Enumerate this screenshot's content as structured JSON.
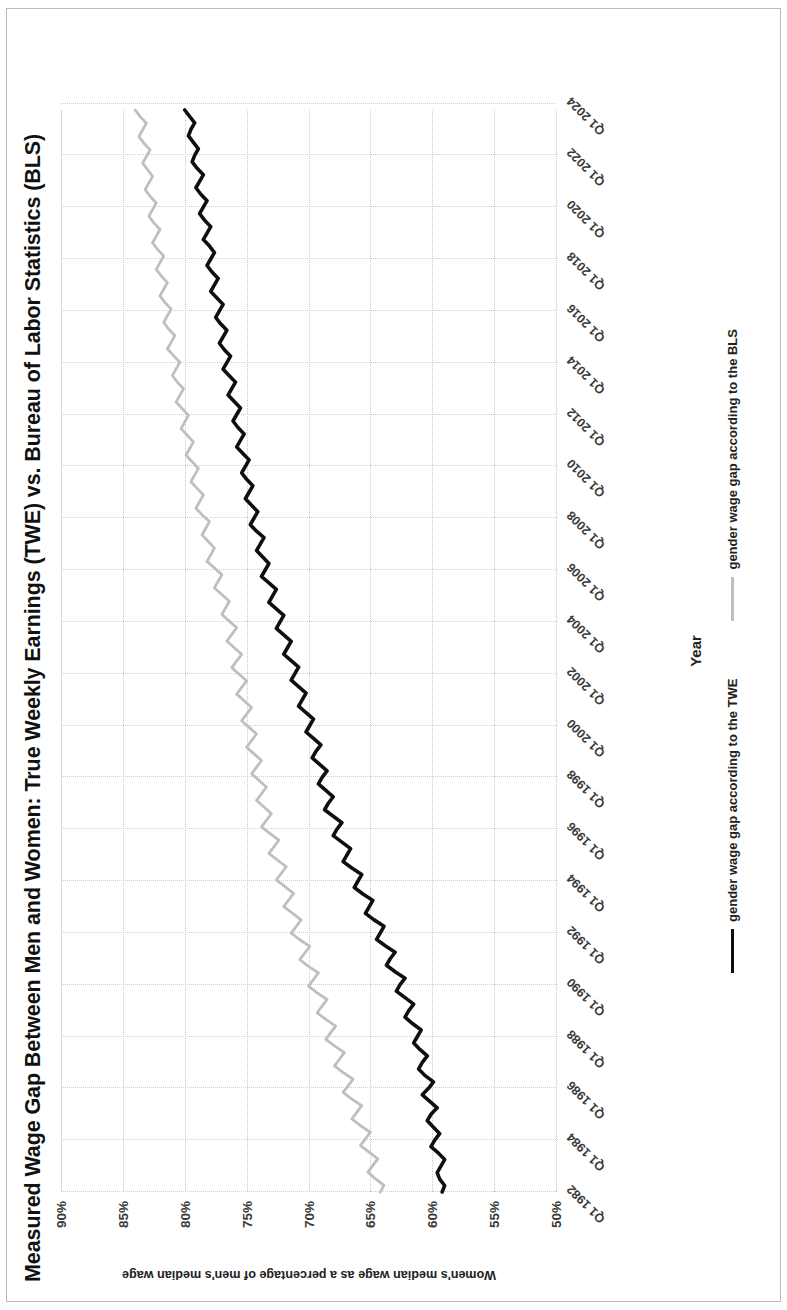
{
  "chart_data": {
    "type": "line",
    "title": "Measured Wage Gap Between Men and Women: True Weekly Earnings (TWE) vs. Bureau of Labor Statistics (BLS)",
    "xlabel": "Year",
    "ylabel": "Women's median wage as a percentage of men's median wage",
    "ylim": [
      50,
      90
    ],
    "ytick_labels": [
      "90%",
      "85%",
      "80%",
      "75%",
      "70%",
      "65%",
      "60%",
      "55%",
      "50%"
    ],
    "ytick_values": [
      90,
      85,
      80,
      75,
      70,
      65,
      60,
      55,
      50
    ],
    "grid": true,
    "legend_position": "bottom",
    "xtick_labels": [
      "Q1 1982",
      "Q1 1984",
      "Q1 1986",
      "Q1 1988",
      "Q1 1990",
      "Q1 1992",
      "Q1 1994",
      "Q1 1996",
      "Q1 1998",
      "Q1 2000",
      "Q1 2002",
      "Q1 2004",
      "Q1 2006",
      "Q1 2008",
      "Q1 2010",
      "Q1 2012",
      "Q1 2014",
      "Q1 2016",
      "Q1 2018",
      "Q1 2020",
      "Q1 2022",
      "Q1 2024"
    ],
    "x_start": "Q1 1982",
    "x_end": "Q1 2024",
    "x_frequency": "quarterly",
    "series": [
      {
        "name": "gender wage gap according to the TWE",
        "color": "#0f0f0f",
        "values": [
          59.2,
          59.0,
          59.4,
          59.6,
          59.3,
          59.0,
          59.5,
          60.1,
          59.8,
          59.4,
          59.9,
          60.4,
          60.1,
          59.6,
          60.2,
          60.8,
          60.3,
          59.9,
          60.6,
          61.1,
          60.8,
          60.4,
          61.0,
          61.5,
          61.2,
          60.9,
          61.6,
          62.2,
          61.9,
          61.5,
          62.2,
          62.9,
          62.6,
          62.2,
          63.0,
          63.7,
          63.4,
          63.0,
          63.8,
          64.5,
          64.2,
          63.9,
          64.7,
          65.4,
          65.1,
          64.8,
          65.6,
          66.3,
          66.0,
          65.7,
          66.5,
          67.2,
          66.9,
          66.6,
          67.3,
          68.0,
          67.7,
          67.3,
          68.0,
          68.7,
          68.4,
          68.0,
          68.6,
          69.2,
          68.9,
          68.5,
          69.1,
          69.7,
          69.4,
          69.0,
          69.6,
          70.2,
          69.9,
          69.6,
          70.2,
          70.8,
          70.5,
          70.2,
          70.8,
          71.4,
          71.1,
          70.8,
          71.4,
          72.0,
          71.7,
          71.4,
          72.0,
          72.6,
          72.3,
          72.0,
          72.6,
          73.2,
          72.9,
          72.6,
          73.2,
          73.8,
          73.5,
          73.2,
          73.7,
          74.2,
          73.9,
          73.6,
          74.2,
          74.7,
          74.4,
          74.1,
          74.6,
          75.1,
          74.8,
          74.5,
          75.0,
          75.4,
          75.1,
          74.8,
          75.3,
          75.8,
          75.5,
          75.2,
          75.7,
          76.1,
          75.8,
          75.5,
          76.0,
          76.5,
          76.2,
          75.9,
          76.4,
          76.9,
          76.6,
          76.3,
          76.8,
          77.2,
          76.9,
          76.6,
          77.1,
          77.5,
          77.2,
          76.9,
          77.4,
          77.9,
          77.6,
          77.3,
          77.8,
          78.2,
          77.9,
          77.6,
          78.0,
          78.5,
          78.2,
          77.9,
          78.4,
          78.8,
          78.5,
          78.2,
          78.7,
          79.1,
          78.8,
          78.5,
          79.0,
          79.4,
          79.2,
          78.9,
          79.3,
          79.7,
          79.5,
          79.2,
          79.6,
          80.0
        ],
        "start_value": 59.2,
        "end_value": 80.0
      },
      {
        "name": "gender wage gap according to the BLS",
        "color": "#bfbfbf",
        "values": [
          64.2,
          63.9,
          64.6,
          65.2,
          64.8,
          64.4,
          65.1,
          65.8,
          65.4,
          65.0,
          65.8,
          66.5,
          66.1,
          65.7,
          66.5,
          67.2,
          66.8,
          66.4,
          67.2,
          67.9,
          67.5,
          67.1,
          67.9,
          68.6,
          68.2,
          67.8,
          68.6,
          69.3,
          68.9,
          68.5,
          69.3,
          70.0,
          69.6,
          69.2,
          70.0,
          70.7,
          70.3,
          69.9,
          70.7,
          71.4,
          71.0,
          70.6,
          71.3,
          72.0,
          71.6,
          71.2,
          71.9,
          72.6,
          72.2,
          71.8,
          72.5,
          73.2,
          72.8,
          72.4,
          73.1,
          73.8,
          73.4,
          73.0,
          73.6,
          74.2,
          73.8,
          73.4,
          74.0,
          74.6,
          74.2,
          73.8,
          74.4,
          75.0,
          74.6,
          74.2,
          74.8,
          75.4,
          75.0,
          74.6,
          75.2,
          75.8,
          75.4,
          75.0,
          75.6,
          76.2,
          75.8,
          75.4,
          76.0,
          76.6,
          76.2,
          75.8,
          76.4,
          77.0,
          76.7,
          76.4,
          77.0,
          77.6,
          77.3,
          77.0,
          77.6,
          78.2,
          77.9,
          77.6,
          78.1,
          78.6,
          78.3,
          78.0,
          78.6,
          79.1,
          78.8,
          78.5,
          79.0,
          79.5,
          79.2,
          78.9,
          79.4,
          79.9,
          79.6,
          79.3,
          79.8,
          80.3,
          80.0,
          79.7,
          80.2,
          80.7,
          80.4,
          80.1,
          80.6,
          81.0,
          80.7,
          80.4,
          80.9,
          81.4,
          81.1,
          80.8,
          81.3,
          81.7,
          81.4,
          81.1,
          81.6,
          82.0,
          81.7,
          81.4,
          81.9,
          82.3,
          82.0,
          81.7,
          82.2,
          82.6,
          82.3,
          82.0,
          82.5,
          82.9,
          82.6,
          82.3,
          82.8,
          83.2,
          82.9,
          82.6,
          83.0,
          83.4,
          83.1,
          82.8,
          83.3,
          83.7,
          83.4,
          83.1,
          83.6,
          84.0
        ],
        "start_value": 64.2,
        "end_value": 84.0
      }
    ]
  },
  "legend": {
    "items": [
      {
        "label": "gender wage gap according to the TWE"
      },
      {
        "label": "gender wage gap according to the BLS"
      }
    ]
  }
}
